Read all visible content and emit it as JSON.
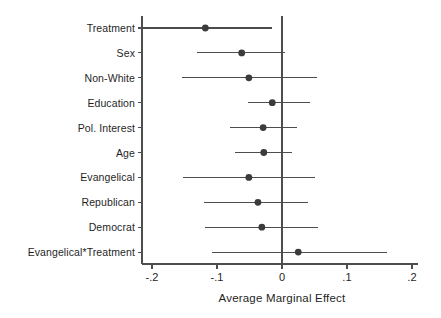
{
  "chart_data": {
    "type": "scatter",
    "subtype": "coefficient-plot",
    "title": "",
    "xlabel": "Average Marginal Effect",
    "ylabel": "",
    "xlim": [
      -0.2,
      0.2
    ],
    "ylim": [
      0,
      11
    ],
    "grid": false,
    "legend": null,
    "reference_line": 0,
    "xticks": [
      -0.2,
      -0.1,
      0,
      0.1,
      0.2
    ],
    "xticklabels": [
      "-.2",
      "-.1",
      "0",
      ".1",
      ".2"
    ],
    "categories": [
      "Treatment",
      "Sex",
      "Non-White",
      "Education",
      "Pol. Interest",
      "Age",
      "Evangelical",
      "Republican",
      "Democrat",
      "Evangelical*Treatment"
    ],
    "estimates": [
      -0.118,
      -0.062,
      -0.051,
      -0.015,
      -0.029,
      -0.028,
      -0.051,
      -0.037,
      -0.031,
      0.025
    ],
    "ci_lower": [
      -0.214,
      -0.131,
      -0.154,
      -0.052,
      -0.08,
      -0.072,
      -0.152,
      -0.12,
      -0.118,
      -0.108
    ],
    "ci_upper": [
      -0.015,
      0.005,
      0.054,
      0.043,
      0.023,
      0.015,
      0.051,
      0.04,
      0.055,
      0.162
    ],
    "marker": "circle",
    "marker_color": "#3b3b3b",
    "line_color": "#4d4d4d",
    "axis_color": "#4d4d4d"
  },
  "axis": {
    "x_title": "Average Marginal Effect"
  }
}
